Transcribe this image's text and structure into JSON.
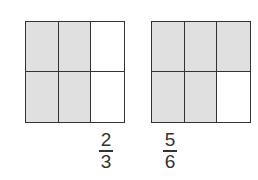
{
  "diagram": {
    "type": "fraction-area-models",
    "colors": {
      "shaded": "#e0e0e0",
      "unshaded": "#ffffff",
      "line": "#333333"
    },
    "models": [
      {
        "rows": 2,
        "cols": 3,
        "shaded_cells": [
          true,
          true,
          false,
          true,
          true,
          false
        ],
        "fraction": {
          "numerator": "2",
          "denominator": "3"
        }
      },
      {
        "rows": 2,
        "cols": 3,
        "shaded_cells": [
          true,
          true,
          true,
          true,
          true,
          false
        ],
        "fraction": {
          "numerator": "5",
          "denominator": "6"
        }
      }
    ]
  }
}
